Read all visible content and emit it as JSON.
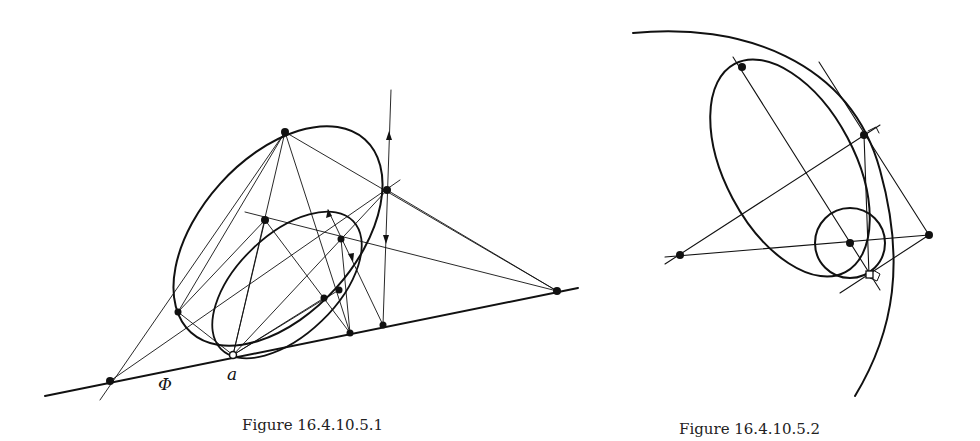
{
  "figures": [
    {
      "id": "fig1",
      "caption": "Figure 16.4.10.5.1",
      "labels": {
        "phi": "Φ",
        "a": "a"
      }
    },
    {
      "id": "fig2",
      "caption": "Figure 16.4.10.5.2"
    }
  ],
  "colors": {
    "ink": "#111111",
    "background": "#ffffff"
  }
}
